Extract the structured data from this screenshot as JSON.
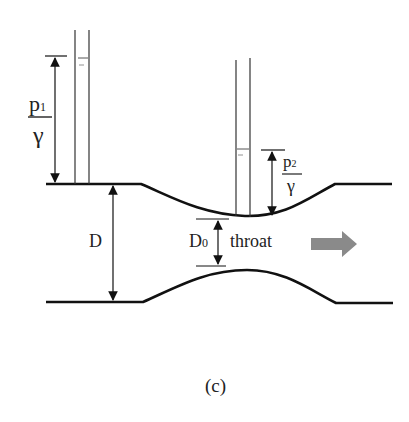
{
  "figure": {
    "type": "venturi-meter-diagram",
    "caption": "(c)",
    "labels": {
      "p1_numerator": "p",
      "p1_subscript": "1",
      "p1_denominator": "γ",
      "p2_numerator": "p",
      "p2_subscript": "2",
      "p2_denominator": "γ",
      "pipe_diameter": "D",
      "throat_diameter": "D",
      "throat_diameter_subscript": "0",
      "throat": "throat"
    },
    "colors": {
      "line": "#111111",
      "flow_arrow": "#8a8a8a",
      "text": "#222222"
    },
    "elements": [
      "inlet piezometer tube",
      "throat piezometer tube",
      "pressure head p1/γ dimension",
      "pressure head p2/γ dimension",
      "pipe diameter D dimension",
      "throat diameter D0 dimension",
      "flow direction arrow",
      "converging-diverging pipe walls"
    ]
  }
}
